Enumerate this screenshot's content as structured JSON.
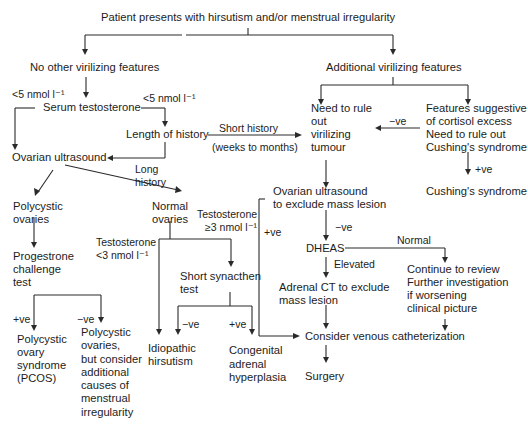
{
  "diagram": {
    "title": "Patient presents with hirsutism and/or menstrual irregularity",
    "nodes": {
      "no_virilizing": "No other virilizing features",
      "additional_virilizing": "Additional virilizing features",
      "serum_testosterone": "Serum testosterone",
      "lt5_left": "<5 nmol l⁻¹",
      "lt5_right": "<5 nmol l⁻¹",
      "length_history": "Length of history",
      "short_history": "Short history",
      "weeks_months": "(weeks to months)",
      "long_history": "Long\nhistory",
      "ovarian_us": "Ovarian ultrasound",
      "rule_out_tumour": "Need to rule\nout\nvirilizing\ntumour",
      "cortisol": "Features suggestive\nof cortisol excess\nNeed to rule out\nCushing's syndrome",
      "neg_cortisol": "−ve",
      "pos_cushing": "+ve",
      "cushings": "Cushing's syndrome",
      "polycystic": "Polycystic\novaries",
      "normal_ovaries": "Normal\novaries",
      "testo_ge3": "Testosterone\n≥3 nmol l⁻¹",
      "testo_lt3": "Testosterone\n<3 nmol l⁻¹",
      "progestrone": "Progestrone\nchallenge\ntest",
      "short_synacthen": "Short synacthen\ntest",
      "ovarian_us_mass": "Ovarian ultrasound\nto exclude mass lesion",
      "pos_ovarian": "+ve",
      "neg_ovarian": "−ve",
      "dheas": "DHEAS",
      "normal": "Normal",
      "elevated": "Elevated",
      "continue_review": "Continue to review\nFurther investigation\nif worsening\nclinical picture",
      "adrenal_ct": "Adrenal CT to exclude\nmass lesion",
      "pcos_pos": "+ve",
      "pcos_neg": "−ve",
      "pcos": "Polycystic\novary\nsyndrome\n(PCOS)",
      "pco_other": "Polycystic\novaries,\nbut consider\nadditional\ncauses of\nmenstrual\nirregularity",
      "synacthen_neg": "−ve",
      "synacthen_pos": "+ve",
      "idiopathic": "Idiopathic\nhirsutism",
      "cah": "Congenital\nadrenal\nhyperplasia",
      "venous": "Consider venous catheterization",
      "surgery": "Surgery"
    }
  }
}
